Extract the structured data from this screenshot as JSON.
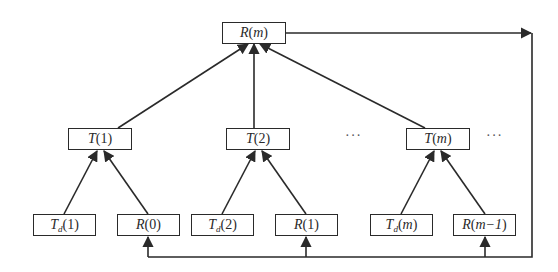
{
  "diagram": {
    "root": {
      "symbol": "R",
      "arg": "m",
      "label": "R(m)"
    },
    "middle": [
      {
        "symbol": "T",
        "arg": "1",
        "label": "T(1)"
      },
      {
        "symbol": "T",
        "arg": "2",
        "label": "T(2)"
      },
      {
        "symbol": "T",
        "arg": "m",
        "label": "T(m)"
      }
    ],
    "leaves": [
      {
        "symbol": "T",
        "sub": "d",
        "arg": "1",
        "label": "T_d(1)"
      },
      {
        "symbol": "R",
        "arg": "0",
        "label": "R(0)"
      },
      {
        "symbol": "T",
        "sub": "d",
        "arg": "2",
        "label": "T_d(2)"
      },
      {
        "symbol": "R",
        "arg": "1",
        "label": "R(1)"
      },
      {
        "symbol": "T",
        "sub": "d",
        "arg": "m",
        "label": "T_d(m)"
      },
      {
        "symbol": "R",
        "arg": "m−1",
        "label": "R(m−1)"
      }
    ],
    "ellipses": [
      "···",
      "···"
    ],
    "edges": [
      [
        "T_d(1)",
        "T(1)"
      ],
      [
        "R(0)",
        "T(1)"
      ],
      [
        "T_d(2)",
        "T(2)"
      ],
      [
        "R(1)",
        "T(2)"
      ],
      [
        "T_d(m)",
        "T(m)"
      ],
      [
        "R(m−1)",
        "T(m)"
      ],
      [
        "T(1)",
        "R(m)"
      ],
      [
        "T(2)",
        "R(m)"
      ],
      [
        "T(m)",
        "R(m)"
      ]
    ],
    "feedback": {
      "from": "R(m)",
      "to": [
        "R(0)",
        "R(1)",
        "R(m−1)"
      ]
    },
    "line_color": "#2a2a2a"
  }
}
